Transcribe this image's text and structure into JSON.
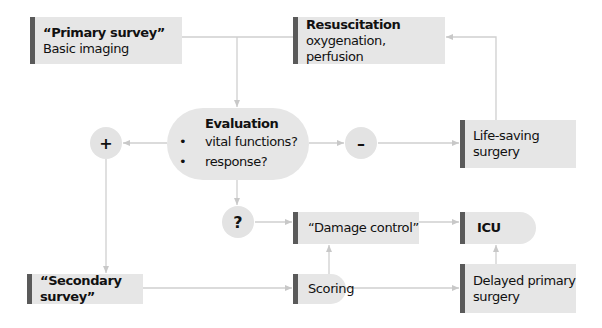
{
  "diagram": {
    "nodes": {
      "primary_survey": {
        "title": "“Primary survey”",
        "subtitle": "Basic imaging"
      },
      "resuscitation": {
        "title": "Resuscitation",
        "subtitle": "oxygenation, perfusion"
      },
      "evaluation": {
        "title": "Evaluation",
        "items": [
          "vital functions?",
          "response?"
        ],
        "bullet": "•"
      },
      "positive": {
        "symbol": "+"
      },
      "negative": {
        "symbol": "–"
      },
      "uncertain": {
        "symbol": "?"
      },
      "life_saving_surgery": {
        "line1": "Life-saving",
        "line2": "surgery"
      },
      "damage_control": {
        "title": "“Damage control”"
      },
      "icu": {
        "title": "ICU"
      },
      "secondary_survey": {
        "title": "“Secondary survey”"
      },
      "scoring": {
        "title": "Scoring"
      },
      "delayed_primary_surgery": {
        "line1": "Delayed primary",
        "line2": "surgery"
      }
    },
    "edges": [
      [
        "primary_survey",
        "resuscitation"
      ],
      [
        "primary_survey",
        "evaluation"
      ],
      [
        "evaluation",
        "positive"
      ],
      [
        "evaluation",
        "negative"
      ],
      [
        "evaluation",
        "uncertain"
      ],
      [
        "negative",
        "life_saving_surgery"
      ],
      [
        "life_saving_surgery",
        "resuscitation"
      ],
      [
        "positive",
        "secondary_survey"
      ],
      [
        "uncertain",
        "damage_control"
      ],
      [
        "damage_control",
        "icu"
      ],
      [
        "secondary_survey",
        "scoring"
      ],
      [
        "scoring",
        "damage_control"
      ],
      [
        "scoring",
        "delayed_primary_surgery"
      ],
      [
        "delayed_primary_surgery",
        "icu"
      ]
    ],
    "colors": {
      "box": "#e6e6e6",
      "accent": "#5a5a5a",
      "line": "#c8c8c8"
    }
  }
}
